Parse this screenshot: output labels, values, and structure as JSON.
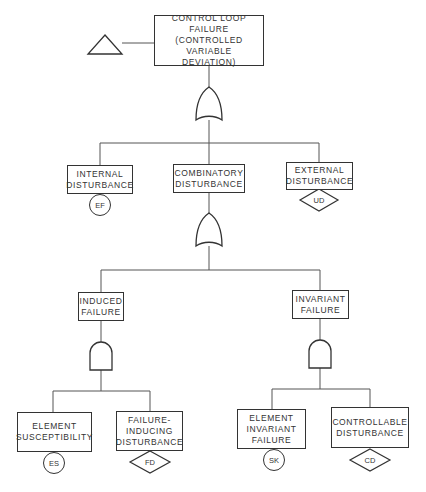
{
  "diagram": {
    "type": "fault-tree",
    "top_event": {
      "label": "CONTROL LOOP\nFAILURE\n(CONTROLLED VARIABLE\nDEVIATION)",
      "transfer_symbol": "triangle"
    },
    "level1": {
      "gate": "OR",
      "children": [
        {
          "label": "INTERNAL\nDISTURBANCE",
          "symbol": "circle",
          "symbol_text": "EF"
        },
        {
          "label": "COMBINATORY\nDISTURBANCE",
          "symbol": "none",
          "symbol_text": ""
        },
        {
          "label": "EXTERNAL\nDISTURBANCE",
          "symbol": "diamond",
          "symbol_text": "UD"
        }
      ]
    },
    "level2": {
      "gate": "OR",
      "children": [
        {
          "label": "INDUCED\nFAILURE",
          "gate": "AND"
        },
        {
          "label": "INVARIANT\nFAILURE",
          "gate": "AND"
        }
      ]
    },
    "level3": {
      "induced": [
        {
          "label": "ELEMENT\nSUSCEPTIBILITY",
          "symbol": "circle",
          "symbol_text": "ES"
        },
        {
          "label": "FAILURE-\nINDUCING\nDISTURBANCE",
          "symbol": "diamond",
          "symbol_text": "FD"
        }
      ],
      "invariant": [
        {
          "label": "ELEMENT\nINVARIANT\nFAILURE",
          "symbol": "circle",
          "symbol_text": "SK"
        },
        {
          "label": "CONTROLLABLE\nDISTURBANCE",
          "symbol": "diamond",
          "symbol_text": "CD"
        }
      ]
    }
  }
}
